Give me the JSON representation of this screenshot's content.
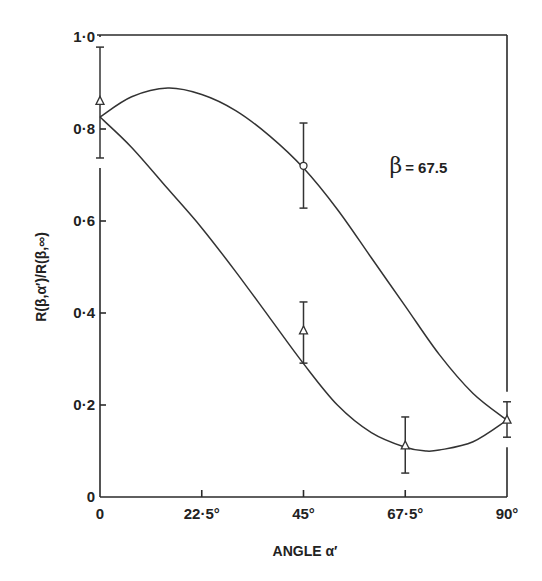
{
  "chart_data": {
    "type": "line",
    "title": "",
    "xlabel": "ANGLE α′",
    "ylabel": "R(β,α′)/R(β,∞)",
    "xlim": [
      0,
      90
    ],
    "ylim": [
      0,
      1.0
    ],
    "grid": false,
    "x_ticks": [
      {
        "value": 0,
        "label": "0"
      },
      {
        "value": 22.5,
        "label": "22·5°"
      },
      {
        "value": 45,
        "label": "45°"
      },
      {
        "value": 67.5,
        "label": "67·5°"
      },
      {
        "value": 90,
        "label": "90°"
      }
    ],
    "y_ticks": [
      {
        "value": 0,
        "label": "0"
      },
      {
        "value": 0.2,
        "label": "0·2"
      },
      {
        "value": 0.4,
        "label": "0·4"
      },
      {
        "value": 0.6,
        "label": "0·6"
      },
      {
        "value": 0.8,
        "label": "0·8"
      },
      {
        "value": 1.0,
        "label": "1·0"
      }
    ],
    "annotation": {
      "symbol": "β",
      "text": "= 67.5",
      "x": 64,
      "y": 0.72
    },
    "series": [
      {
        "name": "upper curve",
        "kind": "fitted-curve",
        "x": [
          0,
          7,
          15,
          22.5,
          30,
          37.5,
          45,
          52.5,
          60,
          67.5,
          75,
          82.5,
          90
        ],
        "y": [
          0.826,
          0.87,
          0.889,
          0.875,
          0.84,
          0.785,
          0.715,
          0.625,
          0.52,
          0.415,
          0.31,
          0.225,
          0.167
        ]
      },
      {
        "name": "lower curve",
        "kind": "fitted-curve",
        "x": [
          0,
          7,
          15,
          22.5,
          30,
          37.5,
          45,
          52.5,
          60,
          67.5,
          72,
          75,
          82.5,
          90
        ],
        "y": [
          0.826,
          0.76,
          0.67,
          0.585,
          0.49,
          0.39,
          0.29,
          0.2,
          0.14,
          0.108,
          0.1,
          0.102,
          0.12,
          0.167
        ]
      },
      {
        "name": "triangle points",
        "marker": "triangle",
        "points": [
          {
            "x": 0,
            "y": 0.86,
            "err_low": 0.737,
            "err_high": 0.978
          },
          {
            "x": 45,
            "y": 0.361,
            "err_low": 0.291,
            "err_high": 0.424
          },
          {
            "x": 67.5,
            "y": 0.111,
            "err_low": 0.052,
            "err_high": 0.174
          },
          {
            "x": 90,
            "y": 0.167,
            "err_low": 0.13,
            "err_high": 0.207
          }
        ]
      },
      {
        "name": "circle points",
        "marker": "circle",
        "points": [
          {
            "x": 45,
            "y": 0.72,
            "err_low": 0.628,
            "err_high": 0.813
          }
        ]
      }
    ]
  }
}
